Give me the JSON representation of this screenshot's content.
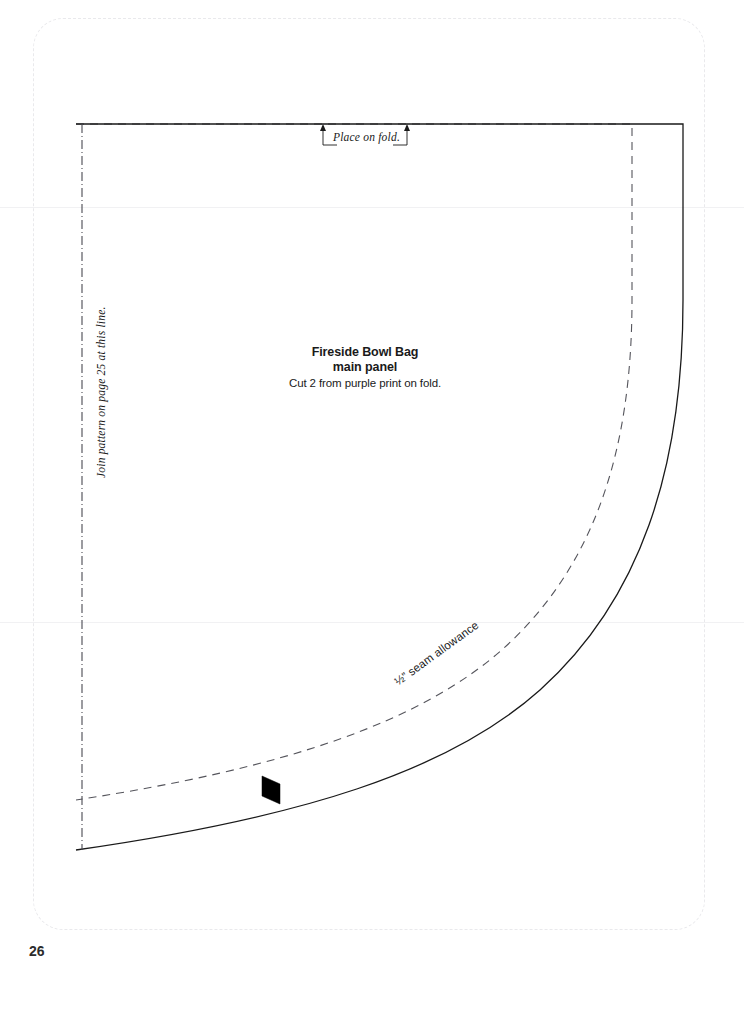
{
  "page": {
    "number": "26",
    "background_color": "#ffffff",
    "trim_border_color": "#e9e9ec"
  },
  "pattern": {
    "title_line_1": "Fireside Bowl Bag",
    "title_line_2": "main panel",
    "cut_instruction": "Cut 2 from purple print on fold.",
    "place_on_fold_label": "Place on fold.",
    "join_pattern_label": "Join pattern on page 25 at this line.",
    "seam_allowance_label": "½” seam allowance",
    "line_color": "#1a1a1a",
    "seam_line_color": "#55555c",
    "fold_line_color": "#4a4a52",
    "notch_color": "#000000"
  },
  "geometry": {
    "cut_line_path": "M 76 124 L 683 124 L 683 300 C 683 470 640 600 540 690 C 448 772 300 818 76 850",
    "seam_line_path": "M 76 124 L 632 124 L 632 300 C 632 452 594 566 504 648 C 421 722 286 768 76 800",
    "fold_line_path": "M 82 124 L 82 850",
    "notch_path": "M 262 776 L 280 784 L 280 804 L 262 796 Z",
    "fold_bracket_left": "M 323 130 L 323 145 L 337 145",
    "fold_bracket_right": "M 407 130 L 407 145 L 393 145",
    "fold_arrow_left_x": 323,
    "fold_arrow_right_x": 407,
    "scan_line_upper_y": 207,
    "scan_line_lower_y": 622
  }
}
